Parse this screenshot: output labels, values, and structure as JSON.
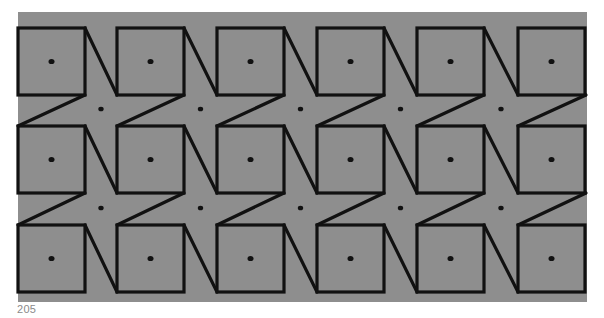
{
  "figure": {
    "background": "#8e8e8e",
    "line_color": "#111111",
    "dot_color": "#111111",
    "field": {
      "x": 18,
      "y": 12,
      "width": 569,
      "height": 290
    },
    "grid": {
      "rows": 3,
      "cols": 6,
      "col_x": [
        18,
        117,
        217,
        317,
        417,
        518
      ],
      "row_y": [
        28,
        126,
        225
      ],
      "square_size": 67
    },
    "star_dots_y": [
      109,
      208
    ]
  },
  "page_number": "205"
}
